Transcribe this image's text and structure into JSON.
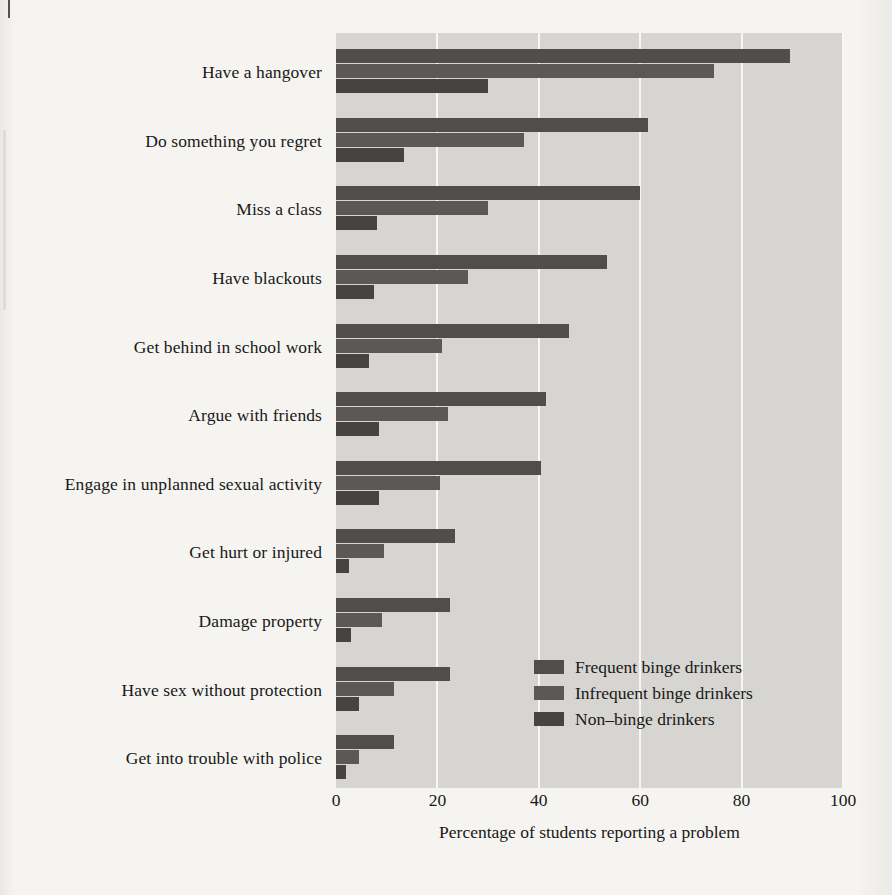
{
  "chart_data": {
    "type": "bar",
    "orientation": "horizontal",
    "title": "",
    "xlabel": "Percentage of students reporting a problem",
    "ylabel": "",
    "xlim": [
      0,
      100
    ],
    "xticks": [
      0,
      20,
      40,
      60,
      80,
      100
    ],
    "xtick_labels": [
      "0",
      "20",
      "40",
      "60",
      "80",
      "100"
    ],
    "grid": true,
    "grid_axis": "x",
    "legend_position": "lower right (inside plot)",
    "categories": [
      "Have a hangover",
      "Do something you regret",
      "Miss a class",
      "Have blackouts",
      "Get behind in school work",
      "Argue with friends",
      "Engage in unplanned sexual activity",
      "Get hurt or injured",
      "Damage property",
      "Have sex without protection",
      "Get into trouble with police"
    ],
    "series": [
      {
        "name": "Frequent binge drinkers",
        "color": "#4f4e4c",
        "values": [
          89.5,
          61.5,
          60,
          53.5,
          46,
          41.5,
          40.5,
          23.5,
          22.5,
          22.5,
          11.5
        ]
      },
      {
        "name": "Infrequent binge drinkers",
        "color": "#5a5957",
        "values": [
          74.5,
          37,
          30,
          26,
          21,
          22,
          20.5,
          9.5,
          9,
          11.5,
          4.5
        ]
      },
      {
        "name": "Non–binge drinkers",
        "color": "#454442",
        "values": [
          30,
          13.5,
          8,
          7.5,
          6.5,
          8.5,
          8.5,
          2.5,
          3,
          4.5,
          2
        ]
      }
    ]
  },
  "legend": {
    "items": [
      {
        "label": "Frequent binge drinkers"
      },
      {
        "label": "Infrequent binge drinkers"
      },
      {
        "label": "Non–binge drinkers"
      }
    ]
  },
  "axis": {
    "x_title": "Percentage of students reporting a problem",
    "x_tick_labels": [
      "0",
      "20",
      "40",
      "60",
      "80",
      "100"
    ]
  },
  "colors": {
    "page_background": "#f4f3ef",
    "plot_background": "#d6d5d1",
    "gridline": "#f7f7f5",
    "series_frequent": "#4f4e4c",
    "series_infrequent": "#5a5957",
    "series_nonbinge": "#454442",
    "text": "#181818"
  }
}
